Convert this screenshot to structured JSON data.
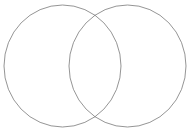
{
  "figure": {
    "type": "venn-diagram",
    "title": "",
    "width": 190,
    "height": 132,
    "background_color": "#ffffff",
    "stroke_color": "#7a7a7a",
    "stroke_width": 0.8,
    "fill": "none",
    "set_count": 2,
    "labels": [],
    "region_labels": [],
    "shapes": [
      {
        "name": "left-set",
        "cx": 62.5,
        "cy": 66,
        "rx": 58.5,
        "ry": 61,
        "fill": "none",
        "stroke": "#7a7a7a"
      },
      {
        "name": "right-set",
        "cx": 127.5,
        "cy": 66,
        "rx": 58.5,
        "ry": 61,
        "fill": "none",
        "stroke": "#7a7a7a"
      }
    ],
    "intersection": {
      "name": "overlap-lens",
      "fill": "none",
      "label": "",
      "top_crossing_x": 96,
      "top_crossing_y": 12,
      "bottom_crossing_x": 96,
      "bottom_crossing_y": 120
    }
  }
}
